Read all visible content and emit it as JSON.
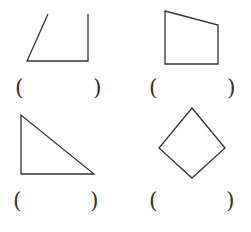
{
  "figures": [
    {
      "id": "a",
      "shape": "open-quadrilateral",
      "points": [
        [
          48,
          14
        ],
        [
          27,
          61
        ],
        [
          88,
          61
        ],
        [
          88,
          14
        ]
      ],
      "closed": false
    },
    {
      "id": "b",
      "shape": "trapezoid",
      "points": [
        [
          165,
          11
        ],
        [
          218,
          25
        ],
        [
          218,
          64
        ],
        [
          165,
          64
        ]
      ],
      "closed": true
    },
    {
      "id": "c",
      "shape": "right-triangle",
      "points": [
        [
          21,
          115
        ],
        [
          21,
          174
        ],
        [
          94,
          174
        ]
      ],
      "closed": true
    },
    {
      "id": "d",
      "shape": "square-rotated",
      "points": [
        [
          192,
          108
        ],
        [
          225,
          148
        ],
        [
          192,
          178
        ],
        [
          159,
          148
        ]
      ],
      "closed": true
    }
  ],
  "answers": [
    {
      "open": "(",
      "close": ")"
    },
    {
      "open": "(",
      "close": ")"
    },
    {
      "open": "(",
      "close": ")"
    },
    {
      "open": "(",
      "close": ")"
    }
  ],
  "stroke_color": "#333333"
}
